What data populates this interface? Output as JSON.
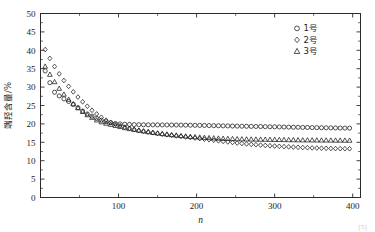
{
  "figure": {
    "background": "#ffffff",
    "foreground": "#1c1c1c",
    "citation_marker": "[5]"
  },
  "chart_data": {
    "type": "scatter",
    "title": "",
    "subtitle": "",
    "xlabel": "n",
    "ylabel": "端羟含量/%",
    "xlim": [
      0,
      410
    ],
    "ylim": [
      0,
      50
    ],
    "xticks": [
      0,
      100,
      200,
      300,
      400
    ],
    "xticklabels": [
      "",
      "100",
      "200",
      "300",
      "400"
    ],
    "xminorticks": [
      50,
      150,
      250,
      350
    ],
    "yticks": [
      0,
      5,
      10,
      15,
      20,
      25,
      30,
      35,
      40,
      45,
      50
    ],
    "yticklabels": [
      "0",
      "5",
      "10",
      "15",
      "20",
      "25",
      "30",
      "35",
      "40",
      "45",
      "50"
    ],
    "grid": false,
    "legend_position": "top-right",
    "marker_fill": "none",
    "marker_edge_color": "#111111",
    "legend": [
      {
        "label": "1号",
        "marker": "circle"
      },
      {
        "label": "2号",
        "marker": "diamond"
      },
      {
        "label": "3号",
        "marker": "triangle"
      }
    ],
    "series": [
      {
        "name": "1号",
        "marker": "circle",
        "x": [
          6,
          12,
          18,
          24,
          30,
          36,
          42,
          48,
          54,
          60,
          66,
          72,
          78,
          84,
          90,
          96,
          102,
          108,
          114,
          120,
          126,
          132,
          138,
          144,
          150,
          156,
          162,
          168,
          174,
          180,
          186,
          192,
          198,
          204,
          210,
          216,
          222,
          228,
          234,
          240,
          246,
          252,
          258,
          264,
          270,
          276,
          282,
          288,
          294,
          300,
          306,
          312,
          318,
          324,
          330,
          336,
          342,
          348,
          354,
          360,
          366,
          372,
          378,
          384,
          390,
          396
        ],
        "y": [
          34.4,
          31.2,
          28.6,
          27.6,
          26.8,
          26.1,
          25.3,
          24.4,
          23.5,
          22.7,
          22.1,
          21.5,
          21.0,
          20.6,
          20.3,
          20.1,
          20.0,
          19.9,
          19.85,
          19.8,
          19.78,
          19.76,
          19.75,
          19.74,
          19.73,
          19.72,
          19.71,
          19.7,
          19.69,
          19.68,
          19.66,
          19.64,
          19.62,
          19.6,
          19.58,
          19.55,
          19.52,
          19.5,
          19.47,
          19.45,
          19.42,
          19.4,
          19.37,
          19.35,
          19.32,
          19.3,
          19.28,
          19.25,
          19.22,
          19.2,
          19.18,
          19.15,
          19.12,
          19.1,
          19.08,
          19.05,
          19.03,
          19.0,
          18.98,
          18.96,
          18.94,
          18.92,
          18.9,
          18.88,
          18.86,
          18.85
        ]
      },
      {
        "name": "2号",
        "marker": "diamond",
        "x": [
          6,
          12,
          18,
          24,
          30,
          36,
          42,
          48,
          54,
          60,
          66,
          72,
          78,
          84,
          90,
          96,
          102,
          108,
          114,
          120,
          126,
          132,
          138,
          144,
          150,
          156,
          162,
          168,
          174,
          180,
          186,
          192,
          198,
          204,
          210,
          216,
          222,
          228,
          234,
          240,
          246,
          252,
          258,
          264,
          270,
          276,
          282,
          288,
          294,
          300,
          306,
          312,
          318,
          324,
          330,
          336,
          342,
          348,
          354,
          360,
          366,
          372,
          378,
          384,
          390,
          396
        ],
        "y": [
          40.2,
          37.8,
          35.6,
          33.6,
          31.8,
          30.2,
          28.7,
          27.3,
          26.0,
          24.8,
          23.7,
          22.7,
          21.8,
          21.0,
          20.4,
          19.9,
          19.5,
          19.1,
          18.8,
          18.5,
          18.2,
          18.0,
          17.8,
          17.6,
          17.4,
          17.2,
          17.05,
          16.9,
          16.75,
          16.6,
          16.45,
          16.3,
          16.15,
          16.0,
          15.85,
          15.7,
          15.55,
          15.4,
          15.25,
          15.1,
          14.95,
          14.8,
          14.68,
          14.56,
          14.45,
          14.34,
          14.24,
          14.15,
          14.06,
          13.98,
          13.9,
          13.83,
          13.76,
          13.7,
          13.64,
          13.58,
          13.53,
          13.48,
          13.44,
          13.4,
          13.36,
          13.33,
          13.3,
          13.28,
          13.26,
          13.25
        ]
      },
      {
        "name": "3号",
        "marker": "triangle",
        "x": [
          6,
          12,
          18,
          24,
          30,
          36,
          42,
          48,
          54,
          60,
          66,
          72,
          78,
          84,
          90,
          96,
          102,
          108,
          114,
          120,
          126,
          132,
          138,
          144,
          150,
          156,
          162,
          168,
          174,
          180,
          186,
          192,
          198,
          204,
          210,
          216,
          222,
          228,
          234,
          240,
          246,
          252,
          258,
          264,
          270,
          276,
          282,
          288,
          294,
          300,
          306,
          312,
          318,
          324,
          330,
          336,
          342,
          348,
          354,
          360,
          366,
          372,
          378,
          384,
          390,
          396
        ],
        "y": [
          35.6,
          33.4,
          31.4,
          29.6,
          28.0,
          26.6,
          25.4,
          24.3,
          23.3,
          22.4,
          21.7,
          21.0,
          20.5,
          20.1,
          19.8,
          19.5,
          19.2,
          18.9,
          18.65,
          18.4,
          18.2,
          18.0,
          17.8,
          17.62,
          17.45,
          17.3,
          17.15,
          17.0,
          16.88,
          16.75,
          16.64,
          16.53,
          16.43,
          16.34,
          16.26,
          16.18,
          16.11,
          16.05,
          16.0,
          15.96,
          15.92,
          15.88,
          15.85,
          15.82,
          15.8,
          15.78,
          15.76,
          15.74,
          15.72,
          15.7,
          15.68,
          15.66,
          15.64,
          15.62,
          15.6,
          15.58,
          15.57,
          15.56,
          15.55,
          15.54,
          15.53,
          15.52,
          15.51,
          15.5,
          15.49,
          15.48
        ]
      }
    ]
  }
}
